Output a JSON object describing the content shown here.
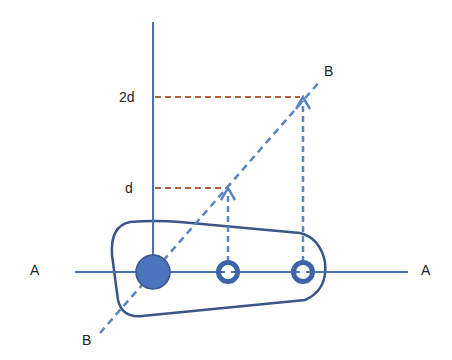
{
  "diagram": {
    "labels": {
      "level_2d": "2d",
      "level_d": "d",
      "axis_a_left": "A",
      "axis_a_right": "A",
      "axis_b_top": "B",
      "axis_b_bottom": "B"
    },
    "colors": {
      "axis_blue": "#4a72b0",
      "outline_navy": "#3a5688",
      "projection_red": "#b0603c",
      "dashed_blue": "#5b84c4",
      "pivot_fill": "#4a74bc"
    },
    "elements": {
      "pivot": "large filled circle on axis A",
      "hole_1": "small ring at distance d",
      "hole_2": "small ring at distance 2d"
    }
  }
}
